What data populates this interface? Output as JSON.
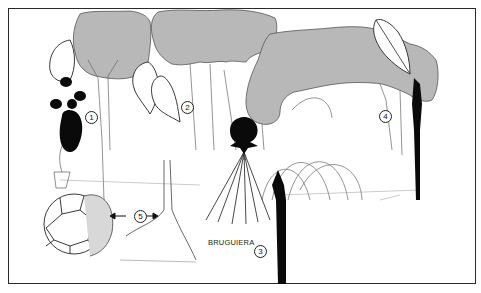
{
  "figure": {
    "colors": {
      "canopy": "#b4b4b4",
      "ink": "#111111",
      "frame": "#2a2a2a",
      "background": "#ffffff"
    },
    "labels": [
      {
        "id": "1",
        "text": "1"
      },
      {
        "id": "2",
        "text": "2"
      },
      {
        "id": "3",
        "text": "3"
      },
      {
        "id": "4",
        "text": "4"
      },
      {
        "id": "5",
        "text": "5"
      }
    ],
    "species_label": "BRUGUIERA",
    "arrow_left": "←",
    "arrow_right": "→"
  }
}
